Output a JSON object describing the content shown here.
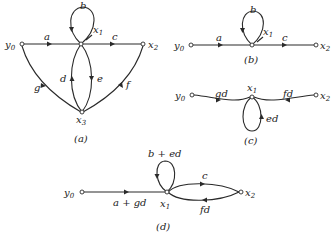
{
  "figure": {
    "panels": [
      {
        "id": "a",
        "caption": "(a)",
        "nodes": [
          "y0",
          "x1",
          "x2",
          "x3"
        ],
        "edges": [
          {
            "from": "y0",
            "to": "x1",
            "gain": "a"
          },
          {
            "from": "x1",
            "to": "x1",
            "gain": "b"
          },
          {
            "from": "x1",
            "to": "x2",
            "gain": "c"
          },
          {
            "from": "x3",
            "to": "x1",
            "gain": "d"
          },
          {
            "from": "x1",
            "to": "x3",
            "gain": "e"
          },
          {
            "from": "x2",
            "to": "x3",
            "gain": "f"
          },
          {
            "from": "y0",
            "to": "x3",
            "gain": "g"
          }
        ]
      },
      {
        "id": "b",
        "caption": "(b)",
        "nodes": [
          "y0",
          "x1",
          "x2"
        ],
        "edges": [
          {
            "from": "y0",
            "to": "x1",
            "gain": "a"
          },
          {
            "from": "x1",
            "to": "x1",
            "gain": "b"
          },
          {
            "from": "x1",
            "to": "x2",
            "gain": "c"
          }
        ]
      },
      {
        "id": "c",
        "caption": "(c)",
        "nodes": [
          "y0",
          "x1",
          "x2"
        ],
        "edges": [
          {
            "from": "y0",
            "to": "x1",
            "gain": "gd"
          },
          {
            "from": "x2",
            "to": "x1",
            "gain": "fd"
          },
          {
            "from": "x1",
            "to": "x1",
            "gain": "ed"
          }
        ]
      },
      {
        "id": "d",
        "caption": "(d)",
        "nodes": [
          "y0",
          "x1",
          "x2"
        ],
        "edges": [
          {
            "from": "y0",
            "to": "x1",
            "gain": "a + gd"
          },
          {
            "from": "x1",
            "to": "x1",
            "gain": "b + ed"
          },
          {
            "from": "x1",
            "to": "x2",
            "gain": "c"
          },
          {
            "from": "x2",
            "to": "x1",
            "gain": "fd"
          }
        ]
      }
    ],
    "labels": {
      "a": {
        "y0": "y",
        "y0_sub": "0",
        "x1": "x",
        "x1_sub": "1",
        "x2": "x",
        "x2_sub": "2",
        "x3": "x",
        "x3_sub": "3",
        "g_a": "a",
        "g_b": "b",
        "g_c": "c",
        "g_d": "d",
        "g_e": "e",
        "g_f": "f",
        "g_g": "g",
        "caption": "(a)"
      },
      "b": {
        "y0": "y",
        "y0_sub": "0",
        "x1": "x",
        "x1_sub": "1",
        "x2": "x",
        "x2_sub": "2",
        "g_a": "a",
        "g_b": "b",
        "g_c": "c",
        "caption": "(b)"
      },
      "c": {
        "y0": "y",
        "y0_sub": "0",
        "x1": "x",
        "x1_sub": "1",
        "x2": "x",
        "x2_sub": "2",
        "g_gd": "gd",
        "g_fd": "fd",
        "g_ed": "ed",
        "caption": "(c)"
      },
      "d": {
        "y0": "y",
        "y0_sub": "0",
        "x1": "x",
        "x1_sub": "1",
        "x2": "x",
        "x2_sub": "2",
        "g_agd": "a + gd",
        "g_bed": "b + ed",
        "g_c": "c",
        "g_fd": "fd",
        "caption": "(d)"
      }
    }
  }
}
